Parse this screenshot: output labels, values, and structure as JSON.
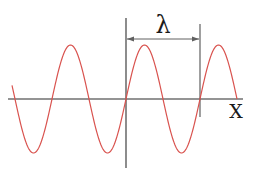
{
  "diagram": {
    "wavelength_label": "λ",
    "x_axis_label": "X",
    "colors": {
      "wave": "#d9534f",
      "axis": "#707070",
      "marker": "#606060",
      "text": "#1a1a1a"
    },
    "geometry": {
      "axis_y": 99,
      "axis_x_start": 8,
      "axis_x_end": 243,
      "yaxis_x": 126,
      "yaxis_top": 18,
      "yaxis_bottom": 168,
      "wave_x_start": 12,
      "wave_x_end": 237,
      "wave_origin_x": 126,
      "wavelength_px": 74,
      "amplitude_px": 54,
      "marker_y": 39,
      "marker_right_x": 200,
      "marker_right_top": 24,
      "marker_right_bottom": 117
    }
  }
}
